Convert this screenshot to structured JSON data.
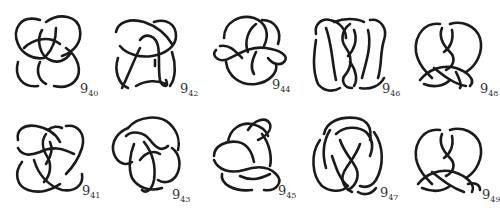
{
  "figure": {
    "rows": [
      {
        "knots": [
          {
            "id": "9_40",
            "main": "9",
            "sub": "40"
          },
          {
            "id": "9_42",
            "main": "9",
            "sub": "42"
          },
          {
            "id": "9_44",
            "main": "9",
            "sub": "44"
          },
          {
            "id": "9_46",
            "main": "9",
            "sub": "46"
          },
          {
            "id": "9_48",
            "main": "9",
            "sub": "48"
          }
        ]
      },
      {
        "knots": [
          {
            "id": "9_41",
            "main": "9",
            "sub": "41"
          },
          {
            "id": "9_43",
            "main": "9",
            "sub": "43"
          },
          {
            "id": "9_45",
            "main": "9",
            "sub": "45"
          },
          {
            "id": "9_47",
            "main": "9",
            "sub": "47"
          },
          {
            "id": "9_49",
            "main": "9",
            "sub": "49"
          }
        ]
      }
    ],
    "stroke_color": "#1a1a1a",
    "background": "#ffffff"
  }
}
